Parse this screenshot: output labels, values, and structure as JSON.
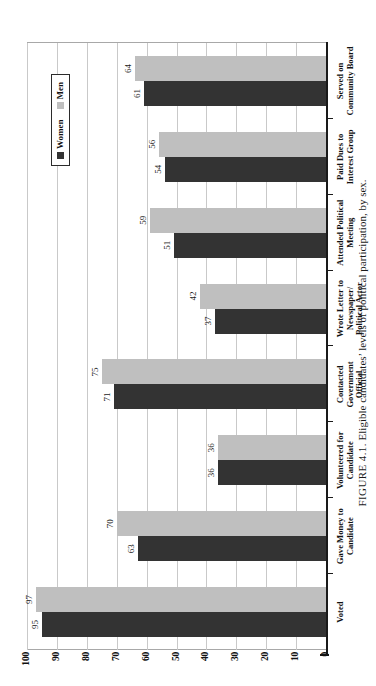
{
  "figure": {
    "caption_prefix": "FIGURE 4.1.",
    "caption_text": "Eligible candidates’ levels of political participation, by sex."
  },
  "legend": {
    "entries": [
      {
        "label": "Women",
        "color": "#333333"
      },
      {
        "label": "Men",
        "color": "#bfbfbf"
      }
    ]
  },
  "axis": {
    "value_ticks": [
      "100",
      "90",
      "80",
      "70",
      "60",
      "50",
      "40",
      "30",
      "20",
      "10",
      "0"
    ]
  },
  "chart_data": {
    "type": "bar",
    "orientation": "vertical",
    "title": "",
    "subtitle": "",
    "xlabel": "",
    "ylabel": "",
    "ylim": [
      0,
      100
    ],
    "grid": true,
    "legend_position": "top-right-inside",
    "categories": [
      "Voted",
      "Gave Money to\nCandidate",
      "Volunteered for\nCandidate",
      "Contacted\nGovernment\nOfficial",
      "Wrote Letter to\nNewspaper/\nPolitical Actor",
      "Attended Political\nMeeting",
      "Paid Dues to\nInterest Group",
      "Served on\nCommunity Board"
    ],
    "series": [
      {
        "name": "Women",
        "color": "#333333",
        "values": [
          95,
          63,
          36,
          71,
          37,
          51,
          54,
          61
        ]
      },
      {
        "name": "Men",
        "color": "#bfbfbf",
        "values": [
          97,
          70,
          36,
          75,
          42,
          59,
          56,
          64
        ]
      }
    ],
    "data_labels": {
      "Women": [
        "95",
        "63",
        "36",
        "71",
        "37",
        "51",
        "54",
        "61"
      ],
      "Men": [
        "97",
        "70",
        "36",
        "75",
        "42",
        "59",
        "56",
        "64"
      ]
    }
  }
}
